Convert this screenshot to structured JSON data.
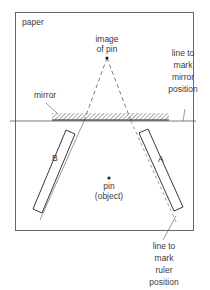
{
  "diagram": {
    "paper_label": "paper",
    "image_label_line1": "image",
    "image_label_line2": "of pin",
    "mirror_label": "mirror",
    "mirror_line_label": [
      "line to",
      "mark",
      "mirror",
      "position"
    ],
    "ruler_line_label": [
      "line to",
      "mark",
      "ruler",
      "position"
    ],
    "pin_label_line1": "pin",
    "pin_label_line2": "(object)",
    "ruler_b_label": "B",
    "ruler_a_label": "A"
  },
  "colors": {
    "line": "#333333",
    "border": "#444444",
    "hatch": "#666666"
  }
}
